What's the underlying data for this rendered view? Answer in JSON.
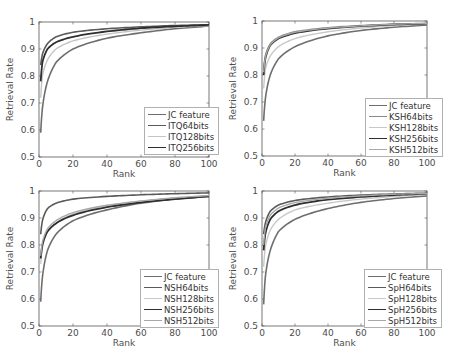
{
  "chart_data": [
    {
      "type": "line",
      "title": "",
      "xlabel": "Rank",
      "ylabel": "Retrieval Rate",
      "xlim": [
        0,
        100
      ],
      "ylim": [
        0.5,
        1
      ],
      "xticks": [
        "0",
        "20",
        "40",
        "60",
        "80",
        "100"
      ],
      "yticks": [
        "0.5",
        "0.6",
        "0.7",
        "0.8",
        "0.9",
        "1"
      ],
      "grid": false,
      "legend_position": "lower right",
      "x": [
        1,
        2,
        5,
        10,
        20,
        40,
        60,
        80,
        100
      ],
      "series": [
        {
          "name": "JC feature",
          "color": "#6e6e6e",
          "width": 1.6,
          "values": [
            0.59,
            0.68,
            0.78,
            0.85,
            0.9,
            0.94,
            0.96,
            0.975,
            0.985
          ]
        },
        {
          "name": "ITQ64bits",
          "color": "#5a5a5a",
          "width": 1.6,
          "values": [
            0.84,
            0.88,
            0.92,
            0.945,
            0.962,
            0.975,
            0.982,
            0.987,
            0.99
          ]
        },
        {
          "name": "ITQ128bits",
          "color": "#c4c4c4",
          "width": 1.4,
          "values": [
            0.72,
            0.8,
            0.86,
            0.9,
            0.93,
            0.955,
            0.97,
            0.98,
            0.987
          ]
        },
        {
          "name": "ITQ256bits",
          "color": "#2e2e2e",
          "width": 1.8,
          "values": [
            0.78,
            0.85,
            0.9,
            0.925,
            0.945,
            0.965,
            0.977,
            0.984,
            0.989
          ]
        }
      ]
    },
    {
      "type": "line",
      "title": "",
      "xlabel": "Rank",
      "ylabel": "Retrieval Rate",
      "xlim": [
        0,
        100
      ],
      "ylim": [
        0.5,
        1
      ],
      "xticks": [
        "0",
        "20",
        "40",
        "60",
        "80",
        "100"
      ],
      "yticks": [
        "0.5",
        "0.6",
        "0.7",
        "0.8",
        "0.9",
        "1"
      ],
      "grid": false,
      "legend_position": "lower right",
      "x": [
        1,
        2,
        5,
        10,
        20,
        40,
        60,
        80,
        100
      ],
      "series": [
        {
          "name": "JC feature",
          "color": "#6e6e6e",
          "width": 1.6,
          "values": [
            0.63,
            0.71,
            0.8,
            0.86,
            0.905,
            0.945,
            0.965,
            0.977,
            0.985
          ]
        },
        {
          "name": "KSH64bits",
          "color": "#8a8a8a",
          "width": 1.6,
          "values": [
            0.82,
            0.87,
            0.915,
            0.94,
            0.96,
            0.975,
            0.983,
            0.988,
            0.991
          ]
        },
        {
          "name": "KSH128bits",
          "color": "#c8c8c8",
          "width": 1.4,
          "values": [
            0.75,
            0.82,
            0.87,
            0.905,
            0.935,
            0.96,
            0.974,
            0.983,
            0.989
          ]
        },
        {
          "name": "KSH256bits",
          "color": "#2e2e2e",
          "width": 1.8,
          "values": [
            0.8,
            0.86,
            0.91,
            0.935,
            0.955,
            0.972,
            0.981,
            0.987,
            0.99
          ]
        },
        {
          "name": "KSH512bits",
          "color": "#a8a8a8",
          "width": 1.4,
          "values": [
            0.81,
            0.865,
            0.912,
            0.938,
            0.958,
            0.974,
            0.982,
            0.988,
            0.991
          ]
        }
      ]
    },
    {
      "type": "line",
      "title": "",
      "xlabel": "Rank",
      "ylabel": "Retrieval Rate",
      "xlim": [
        0,
        100
      ],
      "ylim": [
        0.5,
        1
      ],
      "xticks": [
        "0",
        "20",
        "40",
        "60",
        "80",
        "100"
      ],
      "yticks": [
        "0.5",
        "0.6",
        "0.7",
        "0.8",
        "0.9",
        "1"
      ],
      "grid": false,
      "legend_position": "lower right",
      "x": [
        1,
        2,
        5,
        10,
        20,
        40,
        60,
        80,
        100
      ],
      "series": [
        {
          "name": "JC feature",
          "color": "#6e6e6e",
          "width": 1.6,
          "values": [
            0.59,
            0.68,
            0.78,
            0.84,
            0.89,
            0.93,
            0.955,
            0.97,
            0.98
          ]
        },
        {
          "name": "NSH64bits",
          "color": "#5a5a5a",
          "width": 1.6,
          "values": [
            0.84,
            0.89,
            0.935,
            0.955,
            0.97,
            0.98,
            0.986,
            0.99,
            0.993
          ]
        },
        {
          "name": "NSH128bits",
          "color": "#c8c8c8",
          "width": 1.4,
          "values": [
            0.73,
            0.79,
            0.85,
            0.88,
            0.915,
            0.945,
            0.962,
            0.974,
            0.982
          ]
        },
        {
          "name": "NSH256bits",
          "color": "#2e2e2e",
          "width": 1.8,
          "values": [
            0.75,
            0.8,
            0.85,
            0.88,
            0.91,
            0.94,
            0.958,
            0.97,
            0.98
          ]
        },
        {
          "name": "NSH512bits",
          "color": "#a8a8a8",
          "width": 1.4,
          "values": [
            0.76,
            0.81,
            0.86,
            0.89,
            0.92,
            0.947,
            0.963,
            0.975,
            0.983
          ]
        }
      ]
    },
    {
      "type": "line",
      "title": "",
      "xlabel": "Rank",
      "ylabel": "Retrieval Rate",
      "xlim": [
        0,
        100
      ],
      "ylim": [
        0.5,
        1
      ],
      "xticks": [
        "0",
        "20",
        "40",
        "60",
        "80",
        "100"
      ],
      "yticks": [
        "0.5",
        "0.6",
        "0.7",
        "0.8",
        "0.9",
        "1"
      ],
      "grid": false,
      "legend_position": "lower right",
      "x": [
        1,
        2,
        5,
        10,
        20,
        40,
        60,
        80,
        100
      ],
      "series": [
        {
          "name": "JC feature",
          "color": "#6e6e6e",
          "width": 1.6,
          "values": [
            0.58,
            0.68,
            0.78,
            0.85,
            0.895,
            0.935,
            0.958,
            0.972,
            0.982
          ]
        },
        {
          "name": "SpH64bits",
          "color": "#5a5a5a",
          "width": 1.6,
          "values": [
            0.84,
            0.88,
            0.925,
            0.948,
            0.965,
            0.978,
            0.985,
            0.989,
            0.992
          ]
        },
        {
          "name": "SpH128bits",
          "color": "#c8c8c8",
          "width": 1.4,
          "values": [
            0.72,
            0.79,
            0.855,
            0.895,
            0.93,
            0.955,
            0.97,
            0.98,
            0.987
          ]
        },
        {
          "name": "SpH256bits",
          "color": "#2e2e2e",
          "width": 1.8,
          "values": [
            0.78,
            0.84,
            0.895,
            0.925,
            0.948,
            0.968,
            0.978,
            0.985,
            0.99
          ]
        },
        {
          "name": "SpH512bits",
          "color": "#a8a8a8",
          "width": 1.4,
          "values": [
            0.8,
            0.86,
            0.91,
            0.937,
            0.957,
            0.973,
            0.982,
            0.988,
            0.991
          ]
        }
      ]
    }
  ],
  "panels": [
    {
      "ylabel": "Retrieval Rate",
      "xlabel": "Rank"
    },
    {
      "ylabel": "Retrieval Rate",
      "xlabel": "Rank"
    },
    {
      "ylabel": "Retrieval Rate",
      "xlabel": "Rank"
    },
    {
      "ylabel": "Retrieval Rate",
      "xlabel": "Rank"
    }
  ]
}
